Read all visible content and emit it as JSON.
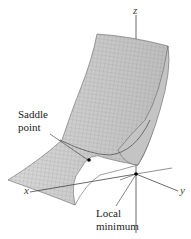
{
  "figure": {
    "type": "3d-surface",
    "axes": {
      "x": "x",
      "y": "y",
      "z": "z"
    },
    "annotations": {
      "saddle": [
        "Saddle",
        "point"
      ],
      "minimum": [
        "Local",
        "minimum"
      ]
    },
    "colors": {
      "surface": "#cfcfcf",
      "mesh": "#8a8a8a",
      "axis": "#444444",
      "point": "#000000"
    }
  }
}
